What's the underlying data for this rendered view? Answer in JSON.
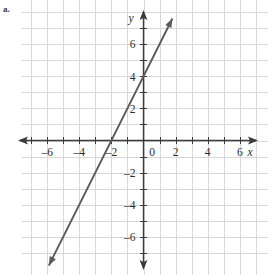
{
  "problem": {
    "label": "a."
  },
  "chart_data": {
    "type": "line",
    "title": "",
    "subtitle": "",
    "xlabel": "x",
    "ylabel": "y",
    "xlim": [
      -7.6,
      7.8
    ],
    "ylim": [
      -7.9,
      8.1
    ],
    "grid": true,
    "grid_step": 1,
    "grid_color": "#d8d8dc",
    "axis_color": "#3b3b3b",
    "line_color": "#5a5a5f",
    "legend": "none",
    "xticks": [
      -6,
      -4,
      -2,
      2,
      4,
      6
    ],
    "xtick_labels": [
      "–6",
      "–4",
      "–2",
      "2",
      "4",
      "6"
    ],
    "yticks": [
      -6,
      -4,
      -2,
      2,
      4,
      6
    ],
    "ytick_labels": [
      "–6",
      "–4",
      "–2",
      "2",
      "4",
      "6"
    ],
    "origin_label": "0",
    "series": [
      {
        "name": "line",
        "equation": "y = 2x + 4",
        "slope": 2,
        "intercept": 4,
        "x_intercept": -2,
        "y_intercept": 4,
        "arrows": "both",
        "x": [
          -5.9,
          1.8
        ],
        "y": [
          -7.8,
          7.6
        ],
        "points": [
          {
            "x": -2,
            "y": 0
          },
          {
            "x": 0,
            "y": 4
          },
          {
            "x": 1,
            "y": 6
          }
        ]
      }
    ]
  },
  "axes": {
    "x_axis_name": "x",
    "y_axis_name": "y",
    "origin": "0"
  }
}
